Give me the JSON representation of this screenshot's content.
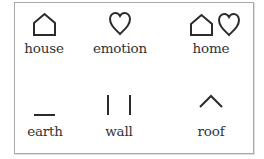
{
  "legend": {
    "items": [
      {
        "id": "house",
        "label": "house",
        "icon": "house-icon"
      },
      {
        "id": "emotion",
        "label": "emotion",
        "icon": "heart-icon"
      },
      {
        "id": "home",
        "label": "home",
        "icon": "house-heart-icon"
      },
      {
        "id": "earth",
        "label": "earth",
        "icon": "horizontal-line-icon"
      },
      {
        "id": "wall",
        "label": "wall",
        "icon": "two-vertical-lines-icon"
      },
      {
        "id": "roof",
        "label": "roof",
        "icon": "chevron-up-icon"
      }
    ]
  },
  "colors": {
    "stroke": "#2b2b2b",
    "border": "#a9a9a9",
    "text": "#333333",
    "background": "#ffffff"
  }
}
